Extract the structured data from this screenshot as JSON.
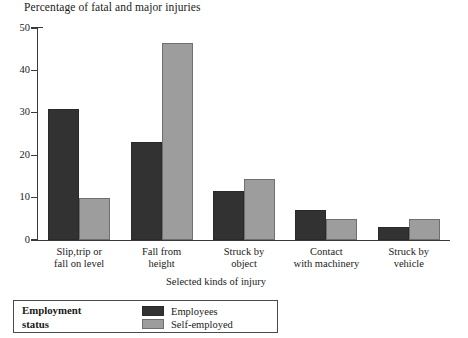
{
  "chart_data": {
    "type": "bar",
    "title": "Percentage of fatal and major injuries",
    "xlabel": "Selected kinds of injury",
    "ylabel": "",
    "ylim": [
      0,
      50
    ],
    "ytick_values": [
      0,
      10,
      20,
      30,
      40,
      50
    ],
    "ytick_labels": [
      "0",
      "10",
      "20",
      "30",
      "40",
      "50"
    ],
    "grid": false,
    "legend_position": "bottom-left",
    "legend_title": "Employment status",
    "categories": [
      "Slip,trip or\nfall on level",
      "Fall from\nheight",
      "Struck by\nobject",
      "Contact\nwith machinery",
      "Struck by\nvehicle"
    ],
    "category_lines": [
      [
        "Slip,trip or",
        "fall on level"
      ],
      [
        "Fall from",
        "height"
      ],
      [
        "Struck by",
        "object"
      ],
      [
        "Contact",
        "with machinery"
      ],
      [
        "Struck by",
        "vehicle"
      ]
    ],
    "series": [
      {
        "name": "Employees",
        "color": "#323232",
        "values": [
          31,
          23,
          11.5,
          7,
          3
        ]
      },
      {
        "name": "Self-employed",
        "color": "#9d9d9d",
        "values": [
          10,
          46.5,
          14.5,
          5,
          5
        ]
      }
    ]
  },
  "legend": {
    "title_line1": "Employment",
    "title_line2": "status",
    "entries": [
      {
        "label": "Employees",
        "swatch": "employees-swatch"
      },
      {
        "label": "Self-employed",
        "swatch": "self-employed-swatch"
      }
    ]
  }
}
